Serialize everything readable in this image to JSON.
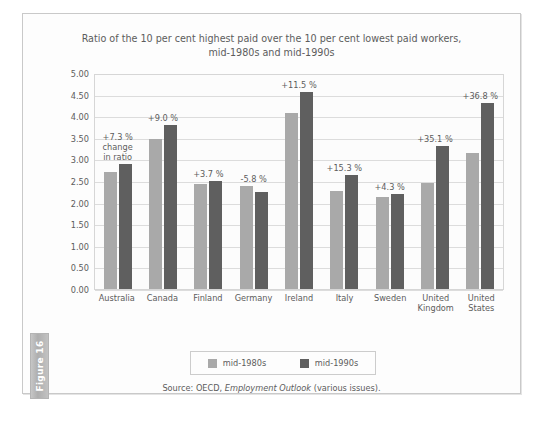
{
  "figure_tab": {
    "label": "Figure 16"
  },
  "chart_data": {
    "type": "bar",
    "title": "Ratio of the 10 per cent highest paid over the 10 per cent lowest paid workers, mid-1980s and mid-1990s",
    "title_line1": "Ratio of the 10 per cent highest paid over the 10 per cent lowest paid workers,",
    "title_line2": "mid-1980s and mid-1990s",
    "xlabel": "",
    "ylabel": "",
    "ylim": [
      0,
      5
    ],
    "ytick_step": 0.5,
    "ytick_labels": [
      "5.00",
      "4.50",
      "4.00",
      "3.50",
      "3.00",
      "2.50",
      "2.00",
      "1.50",
      "1.00",
      "0.50",
      "0.00"
    ],
    "grid": true,
    "legend_position": "bottom",
    "categories": [
      "Australia",
      "Canada",
      "Finland",
      "Germany",
      "Ireland",
      "Italy",
      "Sweden",
      "United Kingdom",
      "United States"
    ],
    "category_lines": [
      [
        "Australia"
      ],
      [
        "Canada"
      ],
      [
        "Finland"
      ],
      [
        "Germany"
      ],
      [
        "Ireland"
      ],
      [
        "Italy"
      ],
      [
        "Sweden"
      ],
      [
        "United",
        "Kingdom"
      ],
      [
        "United",
        "States"
      ]
    ],
    "series": [
      {
        "name": "mid-1980s",
        "color": "#a9a9a9",
        "values": [
          2.7,
          3.48,
          2.42,
          2.38,
          4.08,
          2.28,
          2.12,
          2.45,
          3.15
        ]
      },
      {
        "name": "mid-1990s",
        "color": "#5f5f5f",
        "values": [
          2.9,
          3.79,
          2.51,
          2.24,
          4.55,
          2.63,
          2.21,
          3.31,
          4.31
        ]
      }
    ],
    "annotations": [
      {
        "category": "Australia",
        "text": "+7.3 %",
        "sub": "change\nin ratio"
      },
      {
        "category": "Canada",
        "text": "+9.0 %",
        "sub": ""
      },
      {
        "category": "Finland",
        "text": "+3.7 %",
        "sub": ""
      },
      {
        "category": "Germany",
        "text": "-5.8 %",
        "sub": ""
      },
      {
        "category": "Ireland",
        "text": "+11.5 %",
        "sub": ""
      },
      {
        "category": "Italy",
        "text": "+15.3 %",
        "sub": ""
      },
      {
        "category": "Sweden",
        "text": "+4.3 %",
        "sub": ""
      },
      {
        "category": "United Kingdom",
        "text": "+35.1 %",
        "sub": ""
      },
      {
        "category": "United States",
        "text": "+36.8 %",
        "sub": ""
      }
    ],
    "source_prefix": "Source: OECD, ",
    "source_italic": "Employment Outlook",
    "source_suffix": " (various issues)."
  }
}
